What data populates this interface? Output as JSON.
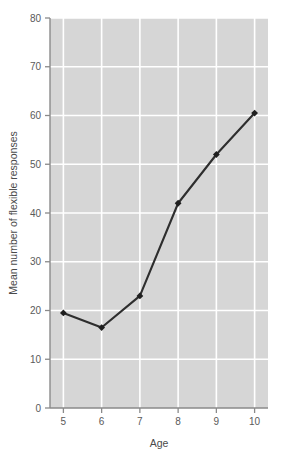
{
  "chart_data": {
    "type": "line",
    "title": "",
    "xlabel": "Age",
    "ylabel": "Mean number of flexible responses",
    "x": [
      5,
      6,
      7,
      8,
      9,
      10
    ],
    "values": [
      19.5,
      16.5,
      23,
      42,
      52,
      60.5
    ],
    "xtick_labels": [
      "5",
      "6",
      "7",
      "8",
      "9",
      "10"
    ],
    "ytick_labels": [
      "0",
      "10",
      "20",
      "30",
      "40",
      "50",
      "60",
      "70",
      "80"
    ],
    "yticks": [
      0,
      10,
      20,
      30,
      40,
      50,
      60,
      70,
      80
    ],
    "xlim": [
      4.65,
      10.35
    ],
    "ylim": [
      0,
      80
    ],
    "grid": true,
    "legend": "none",
    "series": [
      {
        "name": "Mean number of flexible responses",
        "values": [
          19.5,
          16.5,
          23,
          42,
          52,
          60.5
        ]
      }
    ],
    "style": {
      "plot_background": "#d6d6d6",
      "gridline_color": "#ffffff",
      "line_color": "#2e2e2e",
      "marker_color": "#1f1f1f",
      "marker_shape": "diamond",
      "axis_color": "#8a8a8a",
      "text_color": "#5a5a5a",
      "figure_background": "#ffffff"
    }
  }
}
